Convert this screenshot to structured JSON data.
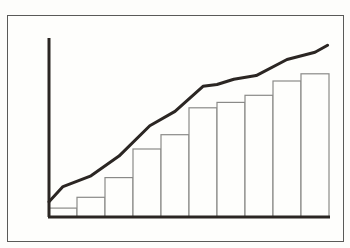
{
  "chart_data": {
    "type": "bar",
    "title": "",
    "xlabel": "",
    "ylabel": "",
    "categories": [
      "1",
      "2",
      "3",
      "4",
      "5",
      "6",
      "7",
      "8",
      "9",
      "10"
    ],
    "series": [
      {
        "name": "bars",
        "type": "bar",
        "values": [
          5,
          11,
          22,
          38,
          46,
          61,
          64,
          68,
          76,
          80
        ]
      },
      {
        "name": "cumulative-line",
        "type": "line",
        "points": [
          {
            "x": 0.0,
            "y": 8.5
          },
          {
            "x": 0.05,
            "y": 17
          },
          {
            "x": 0.15,
            "y": 23
          },
          {
            "x": 0.25,
            "y": 34
          },
          {
            "x": 0.36,
            "y": 51
          },
          {
            "x": 0.45,
            "y": 59
          },
          {
            "x": 0.55,
            "y": 73
          },
          {
            "x": 0.6,
            "y": 74
          },
          {
            "x": 0.66,
            "y": 77
          },
          {
            "x": 0.74,
            "y": 79
          },
          {
            "x": 0.85,
            "y": 88
          },
          {
            "x": 0.95,
            "y": 92
          },
          {
            "x": 0.995,
            "y": 96
          }
        ]
      }
    ],
    "ylim": [
      0,
      100
    ],
    "grid": false,
    "legend": "none",
    "tick_labels": false
  },
  "style": {
    "axis_color": "#2b2623",
    "line_color": "#2b2623",
    "bar_edge_color": "#8a8a88",
    "bar_fill_color": "#fefefc",
    "frame_color": "#5a5a58"
  }
}
